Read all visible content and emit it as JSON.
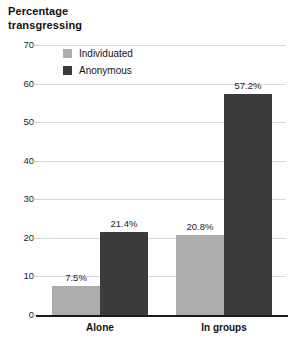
{
  "chart_data": {
    "type": "bar",
    "title": "Percentage\ntransgressing",
    "title_line1": "Percentage",
    "title_line2": "transgressing",
    "xlabel": "",
    "ylabel": "Percentage transgressing",
    "categories": [
      "Alone",
      "In groups"
    ],
    "series": [
      {
        "name": "Individuated",
        "color": "#adadad",
        "values": [
          7.5,
          20.8
        ],
        "labels": [
          "7.5%",
          "20.8%"
        ]
      },
      {
        "name": "Anonymous",
        "color": "#3b3b3b",
        "values": [
          21.4,
          57.2
        ],
        "labels": [
          "21.4%",
          "57.2%"
        ]
      }
    ],
    "ylim": [
      0,
      70
    ],
    "yticks": [
      0,
      10,
      20,
      30,
      40,
      50,
      60,
      70
    ],
    "ytick_labels": [
      "0",
      "10",
      "20",
      "30",
      "40",
      "50",
      "60",
      "70"
    ],
    "grid": true,
    "legend_position": "upper-left-inside"
  },
  "legend": {
    "entries": [
      {
        "label": "Individuated",
        "color": "#adadad"
      },
      {
        "label": "Anonymous",
        "color": "#3b3b3b"
      }
    ]
  },
  "colors": {
    "individuated": "#adadad",
    "anonymous": "#3b3b3b",
    "gridline": "#d8d8d8",
    "axis": "#1a1a1a",
    "background": "#ffffff"
  }
}
